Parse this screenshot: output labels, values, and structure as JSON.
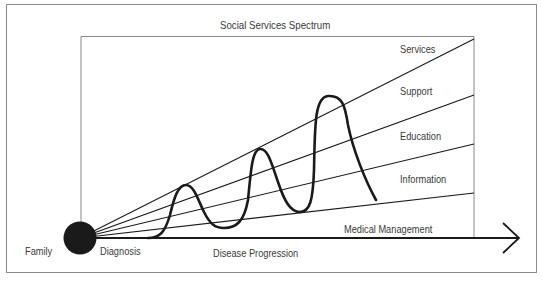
{
  "diagram": {
    "title": "Social Services Spectrum",
    "origin_label_left": "Family",
    "origin_label_right": "Diagnosis",
    "x_axis_label": "Disease Progression",
    "bands": [
      {
        "label": "Services"
      },
      {
        "label": "Support"
      },
      {
        "label": "Education"
      },
      {
        "label": "Information"
      },
      {
        "label": "Medical Management"
      }
    ],
    "colors": {
      "line": "#1a1a1a",
      "border": "#7a7a7a",
      "text": "#3a3a3a",
      "background": "#ffffff"
    }
  }
}
